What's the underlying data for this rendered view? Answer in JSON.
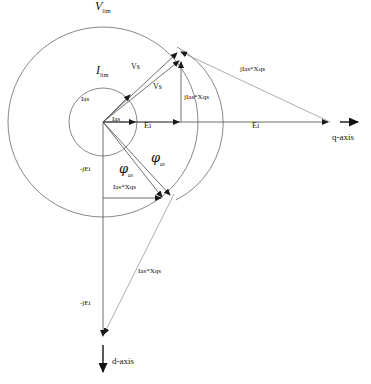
{
  "figure": {
    "type": "phasor-diagram",
    "title_visible": false,
    "background_color": "#ffffff",
    "line_color": "#555555",
    "axis_color": "#333333",
    "text_color": "#111111",
    "width": 371,
    "height": 384
  },
  "origin": {
    "x": 103,
    "y": 122,
    "label": "origin"
  },
  "circles": [
    {
      "name": "voltage-limit-circle",
      "label": "V",
      "label_sub": "lim",
      "cx": 103,
      "cy": 122,
      "r": 95,
      "label_x": 97,
      "label_y": 2
    },
    {
      "name": "current-limit-circle",
      "label": "I",
      "label_sub": "lim",
      "cx": 103,
      "cy": 122,
      "r": 34,
      "label_x": 97,
      "label_y": 66
    }
  ],
  "axes": [
    {
      "name": "q-axis",
      "label": "q-axis",
      "x1": 340,
      "y1": 122,
      "x2": 362,
      "y2": 122,
      "label_x": 333,
      "label_y": 134
    },
    {
      "name": "d-axis",
      "label": "d-axis",
      "x1": 103,
      "y1": 338,
      "x2": 103,
      "y2": 374,
      "label_x": 112,
      "label_y": 360
    }
  ],
  "vectors": [
    {
      "name": "ias-vector-upper",
      "label": "Ias",
      "x1": 103,
      "y1": 122,
      "x2": 132,
      "y2": 93,
      "label_x": 83,
      "label_y": 97
    },
    {
      "name": "ias-vector-horizontal",
      "label": "Ias",
      "x1": 103,
      "y1": 122,
      "x2": 137,
      "y2": 122,
      "label_x": 112,
      "label_y": 115
    },
    {
      "name": "vs-vector-outer",
      "label": "Vs",
      "x1": 103,
      "y1": 122,
      "x2": 179,
      "y2": 51,
      "label_x": 133,
      "label_y": 66
    },
    {
      "name": "vs-vector-inner",
      "label": "Vs",
      "x1": 103,
      "y1": 122,
      "x2": 181,
      "y2": 60,
      "label_x": 155,
      "label_y": 85
    },
    {
      "name": "ei-vector-short",
      "label": "Ei",
      "x1": 103,
      "y1": 122,
      "x2": 181,
      "y2": 122,
      "label_x": 144,
      "label_y": 126
    },
    {
      "name": "ei-vector-long",
      "label": "Ei",
      "x1": 103,
      "y1": 122,
      "x2": 330,
      "y2": 122,
      "label_x": 253,
      "label_y": 126
    },
    {
      "name": "jias-xqs-vertical",
      "label": "jIas*Xqs",
      "x1": 181,
      "y1": 122,
      "x2": 181,
      "y2": 60,
      "label_x": 185,
      "label_y": 96
    },
    {
      "name": "jias-xqs-diagonal",
      "label": "jIas*Xqs",
      "x1": 330,
      "y1": 122,
      "x2": 179,
      "y2": 51,
      "label_x": 243,
      "label_y": 70
    },
    {
      "name": "neg-jei-vector-short",
      "label": "-jEi",
      "x1": 103,
      "y1": 122,
      "x2": 103,
      "y2": 198,
      "label_x": 82,
      "label_y": 169
    },
    {
      "name": "neg-jei-vector-long",
      "label": "-jEi",
      "x1": 103,
      "y1": 122,
      "x2": 103,
      "y2": 338,
      "label_x": 82,
      "label_y": 303
    },
    {
      "name": "ias-xqs-horizontal",
      "label": "Ias*Xqs",
      "x1": 103,
      "y1": 198,
      "x2": 163,
      "y2": 198,
      "label_x": 114,
      "label_y": 186
    },
    {
      "name": "ias-xqs-diagonal-upper",
      "label": "",
      "x1": 103,
      "y1": 122,
      "x2": 172,
      "y2": 196,
      "label_x": 0,
      "label_y": 0
    },
    {
      "name": "ias-xqs-diagonal-lower",
      "label": "Ias*Xqs",
      "x1": 172,
      "y1": 196,
      "x2": 103,
      "y2": 338,
      "label_x": 140,
      "label_y": 272
    },
    {
      "name": "chord-to-lower-point",
      "label": "",
      "x1": 103,
      "y1": 122,
      "x2": 163,
      "y2": 198,
      "label_x": 0,
      "label_y": 0
    }
  ],
  "angles": [
    {
      "name": "phi-as-left",
      "symbol": "φ",
      "subscript": "as",
      "label_x": 121,
      "label_y": 165
    },
    {
      "name": "phi-as-right",
      "symbol": "φ",
      "subscript": "as",
      "label_x": 153,
      "label_y": 154
    }
  ],
  "labels": {
    "v_lim": "V",
    "v_lim_sub": "lim",
    "i_lim": "I",
    "i_lim_sub": "lim",
    "ias_1": "Ias",
    "ias_2": "Ias",
    "vs_1": "Vs",
    "vs_2": "Vs",
    "ei_1": "Ei",
    "ei_2": "Ei",
    "jias_xqs_1": "jIas*Xqs",
    "jias_xqs_2": "jIas*Xqs",
    "neg_jei_1": "-jEi",
    "neg_jei_2": "-jEi",
    "ias_xqs_1": "Ias*Xqs",
    "ias_xqs_2": "Ias*Xqs",
    "q_axis": "q-axis",
    "d_axis": "d-axis",
    "phi_1": "φ",
    "phi_1_sub": "as",
    "phi_2": "φ",
    "phi_2_sub": "as"
  }
}
